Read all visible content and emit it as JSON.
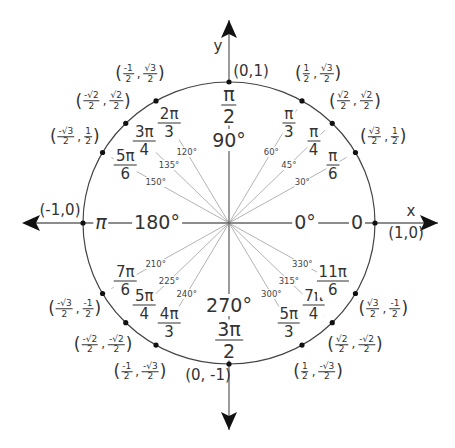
{
  "diagram": {
    "axes": {
      "x_label": "x",
      "y_label": "y"
    },
    "axis_points": [
      {
        "coord": "(1,0)",
        "radian": "0",
        "degree": "0°"
      },
      {
        "coord": "(0,1)",
        "radian_num": "π",
        "radian_den": "2",
        "degree": "90°"
      },
      {
        "coord": "(-1,0)",
        "radian": "π",
        "degree": "180°"
      },
      {
        "coord": "(0, -1)",
        "radian_num": "3π",
        "radian_den": "2",
        "degree": "270°"
      }
    ],
    "points": [
      {
        "deg": 30,
        "degree": "30°",
        "rad_num": "π",
        "rad_den": "6",
        "x_num": "√3",
        "x_den": "2",
        "y_num": "1",
        "y_den": "2"
      },
      {
        "deg": 45,
        "degree": "45°",
        "rad_num": "π",
        "rad_den": "4",
        "x_num": "√2",
        "x_den": "2",
        "y_num": "√2",
        "y_den": "2"
      },
      {
        "deg": 60,
        "degree": "60°",
        "rad_num": "π",
        "rad_den": "3",
        "x_num": "1",
        "x_den": "2",
        "y_num": "√3",
        "y_den": "2"
      },
      {
        "deg": 120,
        "degree": "120°",
        "rad_num": "2π",
        "rad_den": "3",
        "x_num": "-1",
        "x_den": "2",
        "y_num": "√3",
        "y_den": "2"
      },
      {
        "deg": 135,
        "degree": "135°",
        "rad_num": "3π",
        "rad_den": "4",
        "x_num": "-√2",
        "x_den": "2",
        "y_num": "√2",
        "y_den": "2"
      },
      {
        "deg": 150,
        "degree": "150°",
        "rad_num": "5π",
        "rad_den": "6",
        "x_num": "-√3",
        "x_den": "2",
        "y_num": "1",
        "y_den": "2"
      },
      {
        "deg": 210,
        "degree": "210°",
        "rad_num": "7π",
        "rad_den": "6",
        "x_num": "-√3",
        "x_den": "2",
        "y_num": "-1",
        "y_den": "2"
      },
      {
        "deg": 225,
        "degree": "225°",
        "rad_num": "5π",
        "rad_den": "4",
        "x_num": "-√2",
        "x_den": "2",
        "y_num": "-√2",
        "y_den": "2"
      },
      {
        "deg": 240,
        "degree": "240°",
        "rad_num": "4π",
        "rad_den": "3",
        "x_num": "-1",
        "x_den": "2",
        "y_num": "-√3",
        "y_den": "2"
      },
      {
        "deg": 300,
        "degree": "300°",
        "rad_num": "5π",
        "rad_den": "3",
        "x_num": "1",
        "x_den": "2",
        "y_num": "-√3",
        "y_den": "2"
      },
      {
        "deg": 315,
        "degree": "315°",
        "rad_num": "7π",
        "rad_den": "4",
        "x_num": "√2",
        "x_den": "2",
        "y_num": "-√2",
        "y_den": "2"
      },
      {
        "deg": 330,
        "degree": "330°",
        "rad_num": "11π",
        "rad_den": "6",
        "x_num": "√3",
        "x_den": "2",
        "y_num": "-1",
        "y_den": "2"
      }
    ],
    "colors": {
      "line": "#555555",
      "ray": "#aaaaaa",
      "text": "#333333",
      "point": "#111111"
    }
  }
}
